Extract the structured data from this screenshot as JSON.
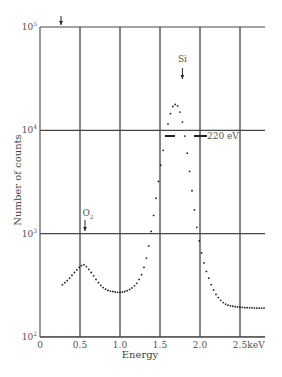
{
  "chart_data": {
    "type": "scatter",
    "title": "",
    "xlabel": "Energy",
    "ylabel": "Number of counts",
    "x_unit": "keV",
    "xlim": [
      0,
      2.8
    ],
    "ylim": [
      100,
      100000
    ],
    "yscale": "log",
    "grid": true,
    "x_ticks": [
      0,
      0.5,
      1.0,
      1.5,
      2.0,
      2.5
    ],
    "x_tick_labels": [
      "0",
      "0.5",
      "1.0",
      "1.5",
      "2.0",
      "2.5"
    ],
    "y_ticks": [
      100,
      1000,
      10000,
      100000
    ],
    "y_tick_labels": [
      {
        "base": "10",
        "exp": "2"
      },
      {
        "base": "10",
        "exp": "3"
      },
      {
        "base": "10",
        "exp": "4"
      },
      {
        "base": "10",
        "exp": "5"
      }
    ],
    "annotations": [
      {
        "text": "Si",
        "x": 1.78,
        "y": 40000,
        "arrow": "down"
      },
      {
        "text": "O",
        "sub": "2",
        "x": 0.55,
        "y": 1500,
        "arrow": "down"
      },
      {
        "text": "220 eV",
        "x": 2.0,
        "y": 9500,
        "note": "FWHM markers"
      },
      {
        "text": "",
        "x": 0.25,
        "y": 100000,
        "arrow": "down",
        "note": "arrow above top axis"
      }
    ],
    "series": [
      {
        "name": "spectrum",
        "x": [
          0.28,
          0.31,
          0.34,
          0.37,
          0.4,
          0.43,
          0.46,
          0.49,
          0.52,
          0.55,
          0.58,
          0.61,
          0.64,
          0.67,
          0.7,
          0.73,
          0.76,
          0.79,
          0.82,
          0.85,
          0.88,
          0.91,
          0.94,
          0.97,
          1.0,
          1.03,
          1.06,
          1.09,
          1.12,
          1.15,
          1.18,
          1.21,
          1.24,
          1.27,
          1.3,
          1.33,
          1.36,
          1.39,
          1.42,
          1.45,
          1.48,
          1.51,
          1.54,
          1.57,
          1.6,
          1.63,
          1.66,
          1.69,
          1.72,
          1.75,
          1.78,
          1.81,
          1.84,
          1.87,
          1.9,
          1.93,
          1.96,
          1.99,
          2.02,
          2.05,
          2.08,
          2.11,
          2.14,
          2.17,
          2.2,
          2.23,
          2.26,
          2.29,
          2.32,
          2.35,
          2.38,
          2.41,
          2.44,
          2.47,
          2.5,
          2.53,
          2.56,
          2.59,
          2.62,
          2.65,
          2.68,
          2.71,
          2.74,
          2.77,
          2.8
        ],
        "values": [
          320,
          335,
          350,
          370,
          395,
          420,
          445,
          470,
          490,
          500,
          480,
          450,
          420,
          390,
          360,
          335,
          315,
          300,
          290,
          282,
          278,
          275,
          272,
          270,
          270,
          272,
          275,
          280,
          288,
          298,
          312,
          330,
          360,
          400,
          470,
          580,
          760,
          1050,
          1500,
          2200,
          3200,
          4600,
          6400,
          8800,
          11500,
          14500,
          17000,
          17800,
          17200,
          15000,
          12000,
          8800,
          6000,
          4000,
          2600,
          1700,
          1150,
          850,
          650,
          520,
          430,
          370,
          320,
          285,
          258,
          240,
          226,
          215,
          208,
          203,
          200,
          198,
          196,
          195,
          194,
          193,
          192,
          192,
          191,
          191,
          190,
          190,
          190,
          190,
          190
        ]
      }
    ]
  }
}
